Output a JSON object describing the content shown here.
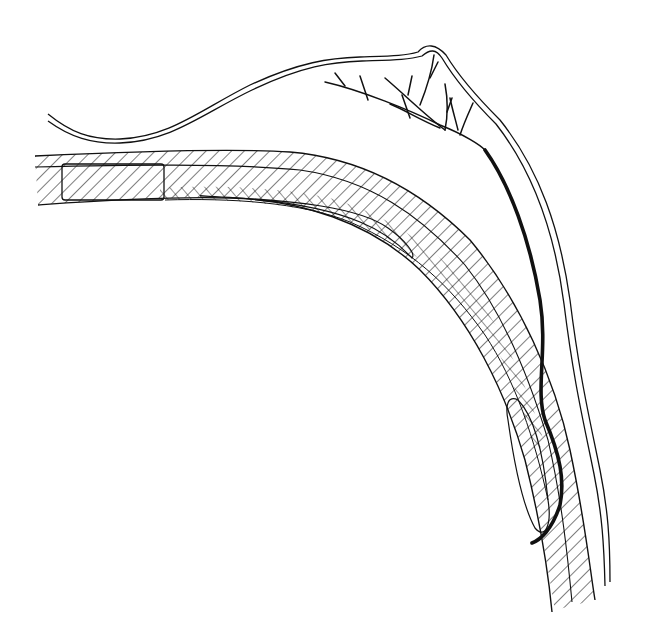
{
  "figure": {
    "kind": "anatomical line drawing",
    "background": "#ffffff",
    "stroke_color": "#111111",
    "has_text_labels": false,
    "elements": [
      "outer-membrane-double-line",
      "branching-vessel-tree",
      "thick-main-vessel",
      "hatched-curved-band",
      "band-inner-layer",
      "band-rect-segment",
      "band-pocket-upper",
      "band-pocket-lower"
    ]
  }
}
